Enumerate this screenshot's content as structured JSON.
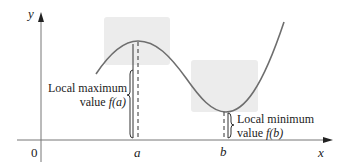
{
  "axes": {
    "x_label": "x",
    "y_label": "y",
    "origin_label": "0"
  },
  "points": {
    "a_label": "a",
    "b_label": "b"
  },
  "annotations": {
    "local_max_line1": "Local maximum",
    "local_max_line2_prefix": "value ",
    "local_max_line2_func": "f(a)",
    "local_min_line1": "Local minimum",
    "local_min_line2_prefix": "value ",
    "local_min_line2_func": "f(b)"
  },
  "colors": {
    "curve": "#6e6e6e",
    "highlight_box": "#ececec",
    "axis": "#555555",
    "text": "#222222"
  }
}
